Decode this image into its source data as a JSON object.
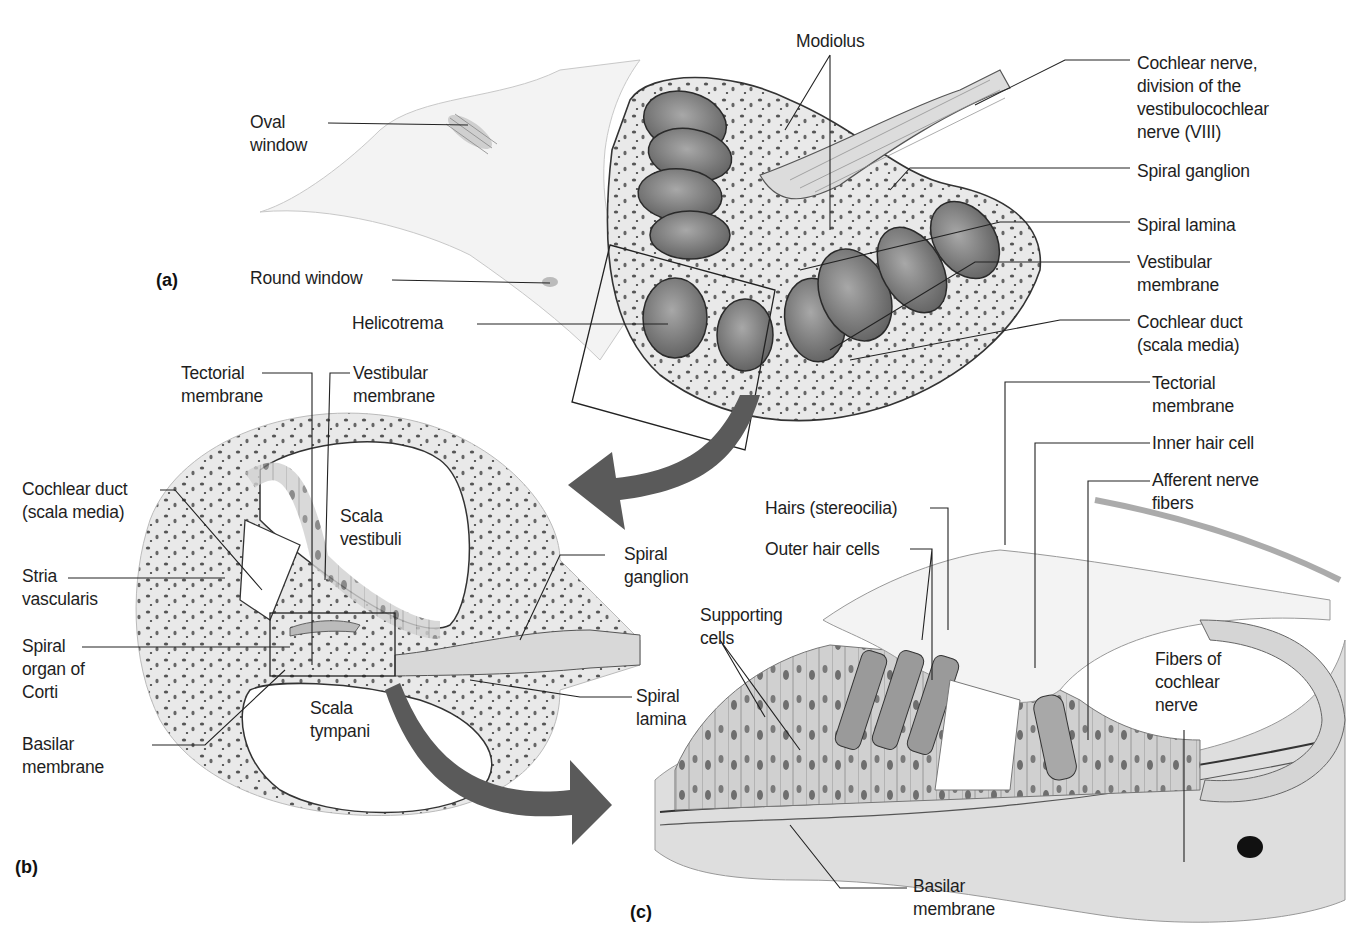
{
  "figure": {
    "panels": {
      "a": {
        "tag": "(a)",
        "labels": {
          "oval_window_1": "Oval",
          "oval_window_2": "window",
          "round_window": "Round window",
          "helicotrema": "Helicotrema",
          "modiolus": "Modiolus",
          "cochlear_nerve_1": "Cochlear nerve,",
          "cochlear_nerve_2": "division of the",
          "cochlear_nerve_3": "vestibulocochlear",
          "cochlear_nerve_4": "nerve (VIII)",
          "spiral_ganglion": "Spiral ganglion",
          "spiral_lamina": "Spiral lamina",
          "vestibular_membrane_1": "Vestibular",
          "vestibular_membrane_2": "membrane",
          "cochlear_duct_1": "Cochlear duct",
          "cochlear_duct_2": "(scala media)"
        }
      },
      "b": {
        "tag": "(b)",
        "labels": {
          "tectorial_membrane_1": "Tectorial",
          "tectorial_membrane_2": "membrane",
          "vestibular_membrane_1": "Vestibular",
          "vestibular_membrane_2": "membrane",
          "cochlear_duct_1": "Cochlear duct",
          "cochlear_duct_2": "(scala media)",
          "scala_vestibuli_1": "Scala",
          "scala_vestibuli_2": "vestibuli",
          "stria_vascularis_1": "Stria",
          "stria_vascularis_2": "vascularis",
          "spiral_ganglion_1": "Spiral",
          "spiral_ganglion_2": "ganglion",
          "spiral_organ_1": "Spiral",
          "spiral_organ_2": "organ of",
          "spiral_organ_3": "Corti",
          "scala_tympani_1": "Scala",
          "scala_tympani_2": "tympani",
          "spiral_lamina_1": "Spiral",
          "spiral_lamina_2": "lamina",
          "basilar_membrane_1": "Basilar",
          "basilar_membrane_2": "membrane"
        }
      },
      "c": {
        "tag": "(c)",
        "labels": {
          "tectorial_membrane_1": "Tectorial",
          "tectorial_membrane_2": "membrane",
          "inner_hair_cell": "Inner hair cell",
          "afferent_nerve_1": "Afferent nerve",
          "afferent_nerve_2": "fibers",
          "hairs": "Hairs (stereocilia)",
          "outer_hair_cells": "Outer hair cells",
          "supporting_cells_1": "Supporting",
          "supporting_cells_2": "cells",
          "fibers_cochlear_1": "Fibers of",
          "fibers_cochlear_2": "cochlear",
          "fibers_cochlear_3": "nerve",
          "basilar_membrane_1": "Basilar",
          "basilar_membrane_2": "membrane"
        }
      }
    },
    "colors": {
      "ink": "#1e1e1e",
      "arrow": "#5a5a5a",
      "bone": "#e6e6e6",
      "duct": "#8a8a8a",
      "tissue": "#cfcfcf"
    }
  }
}
